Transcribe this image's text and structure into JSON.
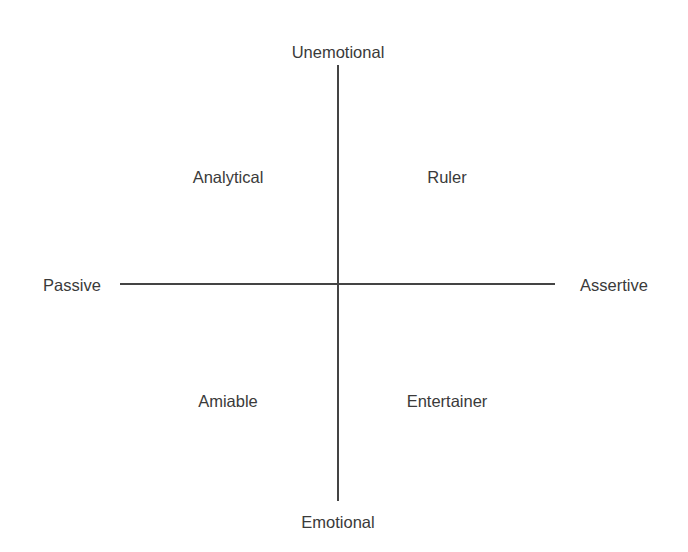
{
  "diagram": {
    "axes": {
      "top": "Unemotional",
      "bottom": "Emotional",
      "left": "Passive",
      "right": "Assertive"
    },
    "quadrants": {
      "top_left": "Analytical",
      "top_right": "Ruler",
      "bottom_left": "Amiable",
      "bottom_right": "Entertainer"
    },
    "colors": {
      "text": "#3a3a3a",
      "lines": "#444444",
      "background": "#ffffff"
    }
  }
}
